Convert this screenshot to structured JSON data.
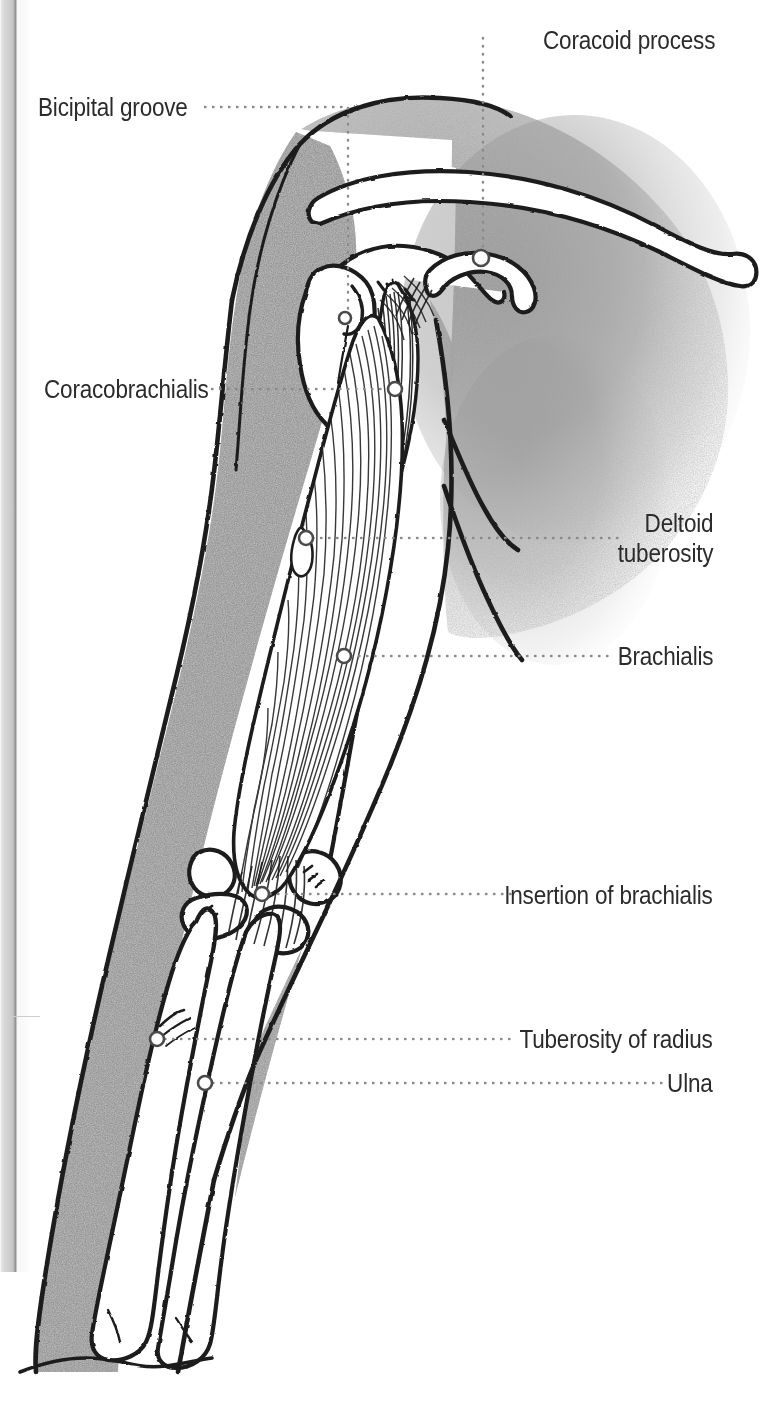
{
  "figure": {
    "kind": "anatomical-illustration",
    "background_color": "#ffffff",
    "ink_color": "#1d1d1d",
    "shading_color": "#9a9a9a",
    "leader_color": "#8a8a8a",
    "text_color": "#2b2b2b"
  },
  "page_edge": {
    "present": true,
    "side": "left",
    "width_px": 17,
    "height_px": 1272
  },
  "labels": [
    {
      "id": "coracoid-process",
      "text": "Coracoid process",
      "align": "left",
      "x": 543,
      "y": 25,
      "lines": [
        "Coracoid process"
      ]
    },
    {
      "id": "bicipital-groove",
      "text": "Bicipital groove",
      "align": "left",
      "x": 38,
      "y": 92,
      "lines": [
        "Bicipital groove"
      ]
    },
    {
      "id": "coracobrachialis",
      "text": "Coracobrachialis",
      "align": "left",
      "x": 44,
      "y": 374,
      "lines": [
        "Coracobrachialis"
      ]
    },
    {
      "id": "deltoid-tuberosity",
      "text": "Deltoid tuberosity",
      "align": "right",
      "x": 713,
      "y": 508,
      "lines": [
        "Deltoid",
        "tuberosity"
      ]
    },
    {
      "id": "brachialis",
      "text": "Brachialis",
      "align": "right",
      "x": 713,
      "y": 641,
      "lines": [
        "Brachialis"
      ]
    },
    {
      "id": "insertion-of-brachialis",
      "text": "Insertion of brachialis",
      "align": "right",
      "x": 713,
      "y": 880,
      "lines": [
        "Insertion of brachialis"
      ]
    },
    {
      "id": "tuberosity-of-radius",
      "text": "Tuberosity of radius",
      "align": "right",
      "x": 713,
      "y": 1024,
      "lines": [
        "Tuberosity of radius"
      ]
    },
    {
      "id": "ulna",
      "text": "Ulna",
      "align": "right",
      "x": 713,
      "y": 1068,
      "lines": [
        "Ulna"
      ]
    }
  ],
  "markers": [
    {
      "id": "marker-bicipital-groove",
      "cx": 345,
      "cy": 318,
      "r": 6
    },
    {
      "id": "marker-coracoid-process",
      "cx": 481,
      "cy": 258,
      "r": 8
    },
    {
      "id": "marker-coracobrachialis",
      "cx": 395,
      "cy": 389,
      "r": 7
    },
    {
      "id": "marker-deltoid-tuberosity",
      "cx": 306,
      "cy": 538,
      "r": 7
    },
    {
      "id": "marker-brachialis",
      "cx": 344,
      "cy": 656,
      "r": 7
    },
    {
      "id": "marker-insertion-of-brachialis",
      "cx": 262,
      "cy": 894,
      "r": 7
    },
    {
      "id": "marker-tuberosity-of-radius",
      "cx": 157,
      "cy": 1039,
      "r": 7
    },
    {
      "id": "marker-ulna",
      "cx": 205,
      "cy": 1083,
      "r": 7
    }
  ],
  "leaders": [
    {
      "id": "leader-coracoid-process",
      "path": "M 483 38 L 483 258"
    },
    {
      "id": "leader-bicipital-groove",
      "path": "M 205 107 L 348 107 L 348 318"
    },
    {
      "id": "leader-coracobrachialis",
      "path": "M 212 389 L 388 389"
    },
    {
      "id": "leader-deltoid-tuberosity",
      "path": "M 313 538 L 622 538"
    },
    {
      "id": "leader-brachialis",
      "path": "M 351 656 L 611 656"
    },
    {
      "id": "leader-insertion-of-brachialis",
      "path": "M 270 894 L 513 894"
    },
    {
      "id": "leader-tuberosity-of-radius",
      "path": "M 165 1039 L 516 1039"
    },
    {
      "id": "leader-ulna",
      "path": "M 213 1083 L 662 1083"
    }
  ]
}
